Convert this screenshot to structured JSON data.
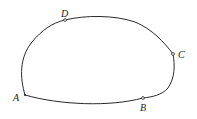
{
  "diagram": {
    "type": "closed-curve",
    "stroke_color": "#2a2a2a",
    "background": "#ffffff",
    "points": [
      {
        "id": "A",
        "label": "A",
        "x": 25,
        "y": 95,
        "label_x": 13,
        "label_y": 101,
        "marker": "vertex"
      },
      {
        "id": "B",
        "label": "B",
        "x": 143,
        "y": 98,
        "label_x": 140,
        "label_y": 111,
        "marker": "open-circle"
      },
      {
        "id": "C",
        "label": "C",
        "x": 173,
        "y": 54,
        "label_x": 178,
        "label_y": 58,
        "marker": "open-circle"
      },
      {
        "id": "D",
        "label": "D",
        "x": 65,
        "y": 20,
        "label_x": 61,
        "label_y": 17,
        "marker": "open-circle"
      }
    ]
  }
}
